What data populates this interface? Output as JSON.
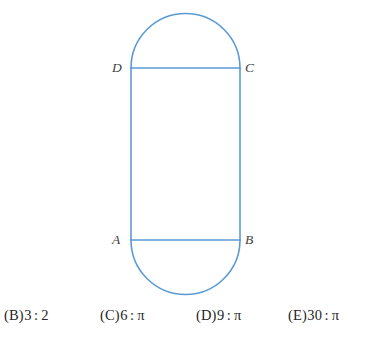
{
  "figure": {
    "name": "stadium-with-inscribed-rectangle",
    "stroke_color": "#5b9bd5",
    "background_color": "#ffffff",
    "vertex_labels": [
      {
        "id": "D",
        "text": "D",
        "position": "top-left"
      },
      {
        "id": "C",
        "text": "C",
        "position": "top-right"
      },
      {
        "id": "A",
        "text": "A",
        "position": "bottom-left"
      },
      {
        "id": "B",
        "text": "B",
        "position": "bottom-right"
      }
    ],
    "segments": [
      {
        "name": "top-chord-DC",
        "from": "D",
        "to": "C"
      },
      {
        "name": "bottom-chord-AB",
        "from": "A",
        "to": "B"
      },
      {
        "name": "left-side",
        "from": "D",
        "to": "A"
      },
      {
        "name": "right-side",
        "from": "C",
        "to": "B"
      }
    ],
    "arcs": [
      {
        "name": "top-semicircle",
        "spans": "D to C"
      },
      {
        "name": "bottom-semicircle",
        "spans": "A to B"
      }
    ]
  },
  "choices": [
    {
      "letter": "(B)",
      "value": "3",
      "ratio": ":",
      "value2": "2"
    },
    {
      "letter": "(C)",
      "value": "6",
      "ratio": ":",
      "value2": "π"
    },
    {
      "letter": "(D)",
      "value": "9",
      "ratio": ":",
      "value2": "π"
    },
    {
      "letter": "(E)",
      "value": "30",
      "ratio": ":",
      "value2": "π"
    }
  ]
}
